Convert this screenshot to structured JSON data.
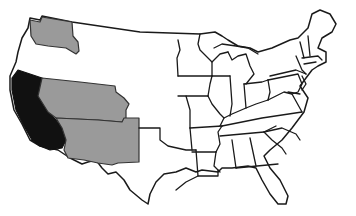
{
  "map": {
    "type": "choropleth",
    "subject": "United States (contiguous 48 states)",
    "colors": {
      "background": "#ffffff",
      "unshaded": "#ffffff",
      "highlight_primary": "#111111",
      "highlight_secondary": "#9a9a9a",
      "border": "#1a1a1a"
    },
    "highlighted_regions": [
      {
        "name": "California",
        "shade": "black"
      },
      {
        "name": "Washington",
        "shade": "gray"
      },
      {
        "name": "Nevada-Utah-Colorado block",
        "shade": "gray"
      },
      {
        "name": "Arizona-New Mexico block",
        "shade": "gray"
      }
    ],
    "text_labels": []
  }
}
